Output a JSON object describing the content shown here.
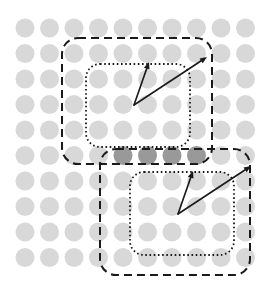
{
  "figure": {
    "title": "Nested receptive fields over a dot grid",
    "background_color": "#ffffff",
    "width": 273,
    "height": 297
  },
  "chart_data": {
    "type": "scatter",
    "title": "Nested receptive fields over a dot grid",
    "subtitle": "",
    "xlabel": "",
    "ylabel": "",
    "grid": false,
    "legend_position": "none",
    "xlim": [
      0,
      273
    ],
    "ylim": [
      297,
      0
    ],
    "dot_grid": {
      "rows": 10,
      "cols": 10,
      "origin_x": 25,
      "origin_y": 28,
      "spacing_x": 24.5,
      "spacing_y": 25.5,
      "radius": 9.5,
      "default_color": "#d8d8d8",
      "highlight_color": "#999999",
      "highlighted_cells": [
        {
          "row": 5,
          "col": 4
        },
        {
          "row": 5,
          "col": 5
        },
        {
          "row": 5,
          "col": 6
        },
        {
          "row": 5,
          "col": 7
        }
      ]
    },
    "regions": [
      {
        "name": "outer-region-top",
        "style": "dashed",
        "stroke": "#1a1a1a",
        "stroke_width": 2,
        "dash_pattern": "8,5",
        "x": 62,
        "y": 38,
        "width": 150,
        "height": 126,
        "corner_radius": 16
      },
      {
        "name": "inner-region-top",
        "style": "dotted",
        "stroke": "#1a1a1a",
        "stroke_width": 1.8,
        "dash_pattern": "1.6,2.6",
        "x": 86,
        "y": 64,
        "width": 104,
        "height": 83,
        "corner_radius": 14
      },
      {
        "name": "outer-region-bottom",
        "style": "dashed",
        "stroke": "#1a1a1a",
        "stroke_width": 2,
        "dash_pattern": "8,5",
        "x": 100,
        "y": 149,
        "width": 150,
        "height": 126,
        "corner_radius": 16
      },
      {
        "name": "inner-region-bottom",
        "style": "dotted",
        "stroke": "#1a1a1a",
        "stroke_width": 1.8,
        "dash_pattern": "1.6,2.6",
        "x": 130,
        "y": 172,
        "width": 104,
        "height": 83,
        "corner_radius": 14
      }
    ],
    "arrows": [
      {
        "name": "short-arrow-top",
        "x1": 134,
        "y1": 105,
        "x2": 149,
        "y2": 62,
        "stroke": "#1a1a1a",
        "stroke_width": 1.6,
        "head_size": 7
      },
      {
        "name": "long-arrow-top",
        "x1": 134,
        "y1": 105,
        "x2": 207,
        "y2": 57,
        "stroke": "#1a1a1a",
        "stroke_width": 1.6,
        "head_size": 7
      },
      {
        "name": "short-arrow-bottom",
        "x1": 178,
        "y1": 214,
        "x2": 193,
        "y2": 171,
        "stroke": "#1a1a1a",
        "stroke_width": 1.6,
        "head_size": 7
      },
      {
        "name": "long-arrow-bottom",
        "x1": 178,
        "y1": 214,
        "x2": 251,
        "y2": 166,
        "stroke": "#1a1a1a",
        "stroke_width": 1.6,
        "head_size": 7
      }
    ],
    "annotations": []
  }
}
